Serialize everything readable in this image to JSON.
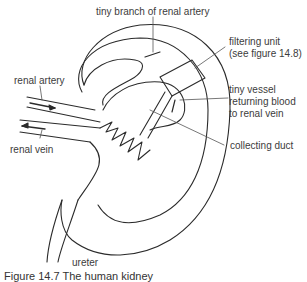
{
  "figure": {
    "caption": "Figure 14.7 The human kidney",
    "labels": {
      "tiny_branch": "tiny branch of renal artery",
      "filtering_unit_1": "filtering unit",
      "filtering_unit_2": "(see figure 14.8)",
      "tiny_vessel_1": "tiny vessel",
      "tiny_vessel_2": "returning blood",
      "tiny_vessel_3": "to renal vein",
      "collecting_duct": "collecting duct",
      "renal_artery": "renal artery",
      "renal_vein": "renal vein",
      "ureter": "ureter"
    },
    "stroke_color": "#2b2b2b",
    "leader_color": "#555555"
  }
}
